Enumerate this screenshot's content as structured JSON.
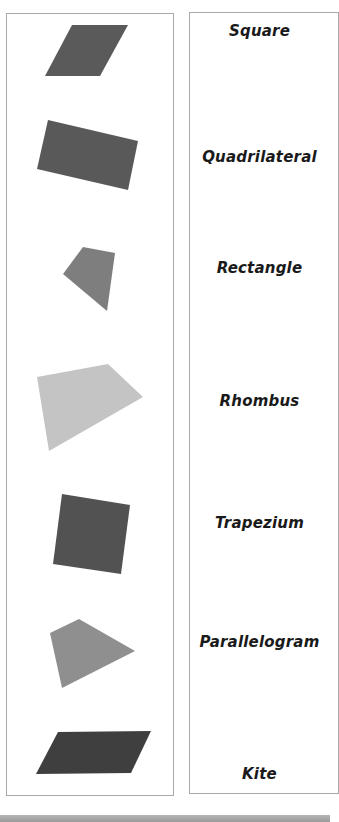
{
  "worksheet": {
    "left_column": {
      "shapes": [
        {
          "id": "shape-1",
          "kind": "parallelogram",
          "color": "#5a5a5a",
          "points": "72,25 128,25 100,76 45,76"
        },
        {
          "id": "shape-2",
          "kind": "rotated-rectangle",
          "color": "#595959",
          "points": "48,120 138,141 128,190 37,169"
        },
        {
          "id": "shape-3",
          "kind": "quadrilateral",
          "color": "#7e7e7e",
          "points": "83,247 115,253 107,311 63,274"
        },
        {
          "id": "shape-4",
          "kind": "trapezium",
          "color": "#c4c4c4",
          "points": "37,377 108,364 143,397 49,451"
        },
        {
          "id": "shape-5",
          "kind": "rotated-square",
          "color": "#525252",
          "points": "62,494 130,505 121,574 53,564"
        },
        {
          "id": "shape-6",
          "kind": "kite",
          "color": "#8f8f8f",
          "points": "79,619 135,651 62,688 50,633"
        },
        {
          "id": "shape-7",
          "kind": "parallelogram",
          "color": "#3f3f3f",
          "points": "58,732 151,731 131,773 36,774"
        }
      ]
    },
    "right_column": {
      "labels": [
        {
          "text": "Square",
          "y": 31
        },
        {
          "text": "Quadrilateral",
          "y": 157
        },
        {
          "text": "Rectangle",
          "y": 268
        },
        {
          "text": "Rhombus",
          "y": 401
        },
        {
          "text": "Trapezium",
          "y": 523
        },
        {
          "text": "Parallelogram",
          "y": 642
        },
        {
          "text": "Kite",
          "y": 774
        }
      ]
    },
    "colors": {
      "panel_border": "#a9a9a9",
      "label_text": "#1a1a1a",
      "bottom_bar": "#a8a8a8"
    }
  }
}
